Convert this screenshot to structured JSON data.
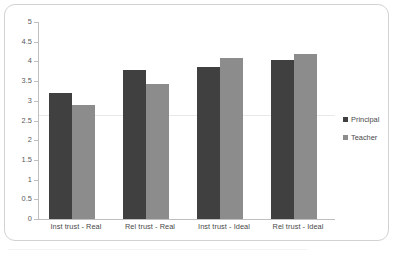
{
  "chart_data": {
    "type": "bar",
    "title": "",
    "subtitle": "",
    "xlabel": "",
    "ylabel": "",
    "ylim": [
      0,
      5
    ],
    "ytick_step": 0.5,
    "yticks": [
      "5",
      "4.5",
      "4",
      "3.5",
      "3",
      "2.5",
      "2",
      "1.5",
      "1",
      "0.5",
      "0"
    ],
    "ytick_values": [
      5,
      4.5,
      4,
      3.5,
      3,
      2.5,
      2,
      1.5,
      1,
      0.5,
      0
    ],
    "grid": "single faint horizontal line near 2.65",
    "legend_position": "right",
    "categories": [
      "Inst trust - Real",
      "Rel trust - Real",
      "Inst trust - Ideal",
      "Rel trust - Ideal"
    ],
    "series": [
      {
        "name": "Principal",
        "color": "#404040",
        "values": [
          3.2,
          3.78,
          3.86,
          4.03
        ]
      },
      {
        "name": "Teacher",
        "color": "#8c8c8c",
        "values": [
          2.89,
          3.43,
          4.08,
          4.19
        ]
      }
    ]
  },
  "colors": {
    "principal": "#404040",
    "teacher": "#8c8c8c",
    "axis": "#bfbfbf",
    "frame": "#d2d2d2",
    "gridline": "#e9e9e9",
    "text": "#4a4a4a",
    "background": "#ffffff"
  }
}
